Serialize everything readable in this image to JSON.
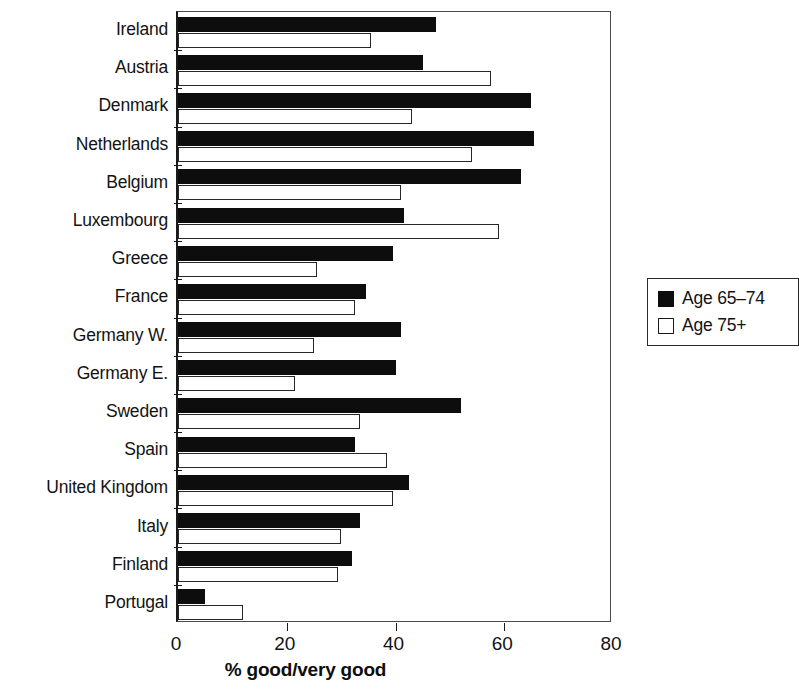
{
  "chart_data": {
    "type": "bar",
    "orientation": "horizontal",
    "title": "",
    "xlabel": "% good/very good",
    "ylabel": "",
    "xlim": [
      0,
      80
    ],
    "xticks": [
      0,
      20,
      40,
      60,
      80
    ],
    "xtick_labels": [
      "0",
      "20",
      "40",
      "60",
      "80"
    ],
    "grid": false,
    "legend_position": "right",
    "categories": [
      "Ireland",
      "Austria",
      "Denmark",
      "Netherlands",
      "Belgium",
      "Luxembourg",
      "Greece",
      "France",
      "Germany W.",
      "Germany E.",
      "Sweden",
      "Spain",
      "United Kingdom",
      "Italy",
      "Finland",
      "Portugal"
    ],
    "series": [
      {
        "name": "Age 65–74",
        "color": "#0d0d0d",
        "values": [
          47.5,
          45,
          65,
          65.5,
          63,
          41.5,
          39.5,
          34.5,
          41,
          40,
          52,
          32.5,
          42.5,
          33.5,
          32,
          5
        ]
      },
      {
        "name": "Age 75+",
        "color": "#ffffff",
        "values": [
          35.5,
          57.5,
          43,
          54,
          41,
          59,
          25.5,
          32.5,
          25,
          21.5,
          33.5,
          38.5,
          39.5,
          30,
          29.5,
          12
        ]
      }
    ]
  },
  "legend": {
    "entries": [
      {
        "label": "Age 65–74",
        "swatch": "filled-square-icon"
      },
      {
        "label": "Age 75+",
        "swatch": "outlined-square-icon"
      }
    ]
  },
  "axis": {
    "x_title": "% good/very good",
    "x_tick_labels": [
      "0",
      "20",
      "40",
      "60",
      "80"
    ]
  }
}
